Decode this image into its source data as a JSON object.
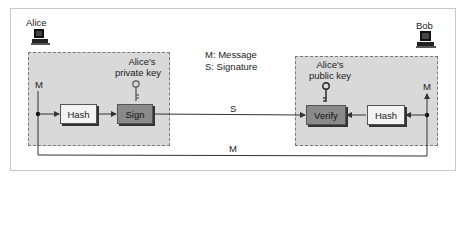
{
  "parties": {
    "sender": {
      "name": "Alice",
      "icon": "computer-icon"
    },
    "receiver": {
      "name": "Bob",
      "icon": "computer-icon"
    }
  },
  "legend": {
    "m": "M: Message",
    "s": "S: Signature"
  },
  "sender_zone": {
    "key_label_line1": "Alice's",
    "key_label_line2": "private key",
    "key_icon": "key-icon",
    "message_label": "M",
    "hash_label": "Hash",
    "sign_label": "Sign"
  },
  "receiver_zone": {
    "key_label_line1": "Alice's",
    "key_label_line2": "public key",
    "key_icon": "key-icon",
    "message_label": "M",
    "hash_label": "Hash",
    "verify_label": "Verify"
  },
  "channels": {
    "signature_label": "S",
    "message_label": "M"
  },
  "colors": {
    "zone_fill": "#d9d9d9",
    "light_box": "#f3f3f3",
    "dark_box": "#8a8a8a",
    "line": "#333333"
  }
}
